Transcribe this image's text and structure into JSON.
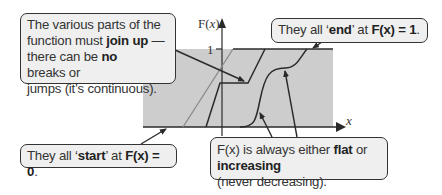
{
  "diagram": {
    "axes": {
      "y_label_prefix": "F(",
      "y_label_var": "x",
      "y_label_suffix": ")",
      "y_tick_1": "1",
      "x_label": "x"
    },
    "colors": {
      "shaded_region": "#cdcdcd",
      "curve": "#2a2a2a",
      "light_curve": "#8a8a8a",
      "callout_fill": "#efefef",
      "callout_border": "#333333"
    },
    "callouts": {
      "join_up": {
        "l1": "The various parts of the",
        "l2a": "function must ",
        "l2b": "join up",
        "l2c": " —",
        "l3a": "there can be ",
        "l3b": "no",
        "l3c": " breaks or",
        "l4": "jumps (it’s continuous)."
      },
      "end": {
        "a": "They all ‘",
        "b": "end",
        "c": "’ at ",
        "d": "F(x) = 1",
        "e": "."
      },
      "start": {
        "a": "They all ‘",
        "b": "start",
        "c": "’ at ",
        "d": "F(x) = 0",
        "e": "."
      },
      "flat": {
        "l1a": "F(x) is always either ",
        "l1b": "flat",
        "l1c": " or",
        "l2a": "increasing",
        "l2b": " (never decreasing)."
      }
    }
  }
}
